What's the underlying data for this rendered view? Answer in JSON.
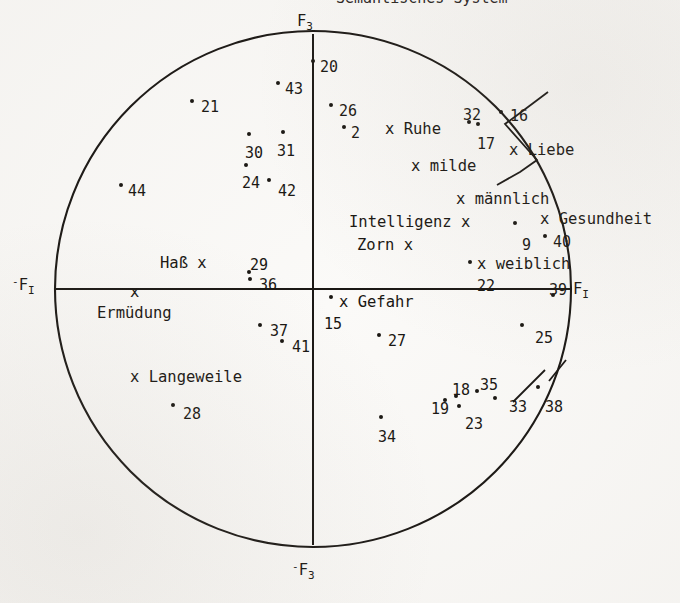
{
  "figure": {
    "type": "scatter",
    "clipped_top_text": "Semantisches System"
  },
  "axes": {
    "top_label": "F",
    "top_label_sub": "3",
    "bottom_label": "F",
    "bottom_label_sub": "3",
    "bottom_label_sign": "-",
    "left_label": "F",
    "left_label_sub": "I",
    "left_label_sign": "-",
    "right_label": "F",
    "right_label_sub": "I"
  },
  "chart_data": {
    "type": "scatter",
    "title": "Semantisches System",
    "xlabel": "F_I",
    "ylabel": "F_3",
    "grid": false,
    "legend": "none",
    "axis_style": "circle with crossed axes",
    "numbered_points": [
      {
        "label": "20",
        "x": 320,
        "y": 60,
        "dx": 313,
        "dy": 61
      },
      {
        "label": "43",
        "x": 285,
        "y": 82,
        "dx": 278,
        "dy": 83
      },
      {
        "label": "21",
        "x": 201,
        "y": 100,
        "dx": 192,
        "dy": 101
      },
      {
        "label": "26",
        "x": 339,
        "y": 104,
        "dx": 331,
        "dy": 105
      },
      {
        "label": "32",
        "x": 463,
        "y": 108,
        "dx": 469,
        "dy": 122
      },
      {
        "label": "16",
        "x": 510,
        "y": 109,
        "dx": 501,
        "dy": 112
      },
      {
        "label": "2",
        "x": 351,
        "y": 126,
        "dx": 344,
        "dy": 127
      },
      {
        "label": "17",
        "x": 477,
        "y": 137,
        "dx": 478,
        "dy": 124
      },
      {
        "label": "30",
        "x": 245,
        "y": 146,
        "dx": 249,
        "dy": 134
      },
      {
        "label": "31",
        "x": 277,
        "y": 144,
        "dx": 283,
        "dy": 132
      },
      {
        "label": "44",
        "x": 128,
        "y": 184,
        "dx": 121,
        "dy": 185
      },
      {
        "label": "24",
        "x": 242,
        "y": 176,
        "dx": 246,
        "dy": 165
      },
      {
        "label": "42",
        "x": 278,
        "y": 184,
        "dx": 269,
        "dy": 180
      },
      {
        "label": "9",
        "x": 522,
        "y": 238,
        "dx": 515,
        "dy": 223
      },
      {
        "label": "40",
        "x": 553,
        "y": 235,
        "dx": 545,
        "dy": 236
      },
      {
        "label": "29",
        "x": 250,
        "y": 258,
        "dx": 249,
        "dy": 272
      },
      {
        "label": "36",
        "x": 259,
        "y": 278,
        "dx": 250,
        "dy": 279
      },
      {
        "label": "22",
        "x": 477,
        "y": 279,
        "dx": 470,
        "dy": 262
      },
      {
        "label": "39",
        "x": 549,
        "y": 283,
        "dx": 553,
        "dy": 295
      },
      {
        "label": "15",
        "x": 324,
        "y": 317,
        "dx": 331,
        "dy": 297
      },
      {
        "label": "25",
        "x": 535,
        "y": 331,
        "dx": 522,
        "dy": 325
      },
      {
        "label": "37",
        "x": 270,
        "y": 324,
        "dx": 260,
        "dy": 325
      },
      {
        "label": "27",
        "x": 388,
        "y": 334,
        "dx": 379,
        "dy": 335
      },
      {
        "label": "41",
        "x": 292,
        "y": 340,
        "dx": 282,
        "dy": 341
      },
      {
        "label": "28",
        "x": 183,
        "y": 407,
        "dx": 173,
        "dy": 405
      },
      {
        "label": "18",
        "x": 452,
        "y": 383,
        "dx": 456,
        "dy": 396
      },
      {
        "label": "35",
        "x": 480,
        "y": 378,
        "dx": 477,
        "dy": 391
      },
      {
        "label": "19",
        "x": 431,
        "y": 402,
        "dx": 445,
        "dy": 400
      },
      {
        "label": "33",
        "x": 509,
        "y": 400,
        "dx": 495,
        "dy": 398
      },
      {
        "label": "38",
        "x": 545,
        "y": 400,
        "dx": 538,
        "dy": 387
      },
      {
        "label": "23",
        "x": 465,
        "y": 417,
        "dx": 459,
        "dy": 406
      },
      {
        "label": "34",
        "x": 378,
        "y": 430,
        "dx": 381,
        "dy": 417
      }
    ],
    "concept_terms": [
      {
        "label": "x Ruhe",
        "x": 385,
        "y": 122
      },
      {
        "label": "x Liebe",
        "x": 509,
        "y": 143
      },
      {
        "label": "x milde",
        "x": 411,
        "y": 159
      },
      {
        "label": "x männlich",
        "x": 456,
        "y": 192
      },
      {
        "label": "x Gesundheit",
        "x": 540,
        "y": 212
      },
      {
        "label": "Intelligenz x",
        "x": 349,
        "y": 215
      },
      {
        "label": "Zorn x",
        "x": 357,
        "y": 238
      },
      {
        "label": "x weiblich",
        "x": 477,
        "y": 257
      },
      {
        "label": "Haß x",
        "x": 160,
        "y": 256
      },
      {
        "label": "x",
        "x": 130,
        "y": 285
      },
      {
        "label": "Ermüdung",
        "x": 97,
        "y": 306
      },
      {
        "label": "x Gefahr",
        "x": 339,
        "y": 295
      },
      {
        "label": "x Langeweile",
        "x": 130,
        "y": 370
      }
    ],
    "point_count": 32,
    "term_count": 13
  }
}
